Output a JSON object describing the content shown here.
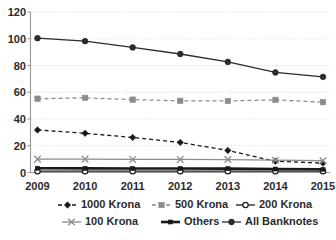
{
  "chart_data": {
    "type": "line",
    "title": "",
    "subtitle": "",
    "xlabel": "",
    "ylabel": "",
    "x": [
      "2009",
      "2010",
      "2011",
      "2012",
      "2013",
      "2014",
      "2015"
    ],
    "categories": [
      "2009",
      "2010",
      "2011",
      "2012",
      "2013",
      "2014",
      "2015"
    ],
    "ylim": [
      0,
      120
    ],
    "yticks": [
      0,
      20,
      40,
      60,
      80,
      100,
      120
    ],
    "ytick_labels": [
      "0",
      "20",
      "40",
      "60",
      "80",
      "100",
      "120"
    ],
    "xtick_labels": [
      "2009",
      "2010",
      "2011",
      "2012",
      "2013",
      "2014",
      "2015"
    ],
    "grid": "horizontal-dotted",
    "legend_position": "bottom",
    "legend_columns": 3,
    "series": [
      {
        "name": "1000 Krona",
        "values": [
          31.8,
          29.3,
          26.2,
          22.5,
          16.5,
          8.4,
          7.0
        ],
        "color": "#1a1a1a",
        "style": "dashed",
        "marker": "diamond"
      },
      {
        "name": "500 Krona",
        "values": [
          55.2,
          55.8,
          54.5,
          53.6,
          53.5,
          54.3,
          52.6
        ],
        "color": "#8c8c8c",
        "style": "dashed",
        "marker": "square"
      },
      {
        "name": "200 Krona",
        "values": [
          1.0,
          1.0,
          1.0,
          1.0,
          1.0,
          1.0,
          1.0
        ],
        "color": "#1a1a1a",
        "style": "solid",
        "marker": "circle-open"
      },
      {
        "name": "100 Krona",
        "values": [
          10.0,
          10.0,
          9.8,
          9.8,
          9.7,
          9.2,
          8.8
        ],
        "color": "#8c8c8c",
        "style": "solid",
        "marker": "cross"
      },
      {
        "name": "Others",
        "values": [
          3.2,
          3.1,
          3.0,
          3.0,
          2.9,
          2.6,
          2.4
        ],
        "color": "#1a1a1a",
        "style": "solid-bold",
        "marker": "square-small"
      },
      {
        "name": "All Banknotes",
        "values": [
          100.4,
          98.2,
          93.5,
          88.6,
          82.7,
          74.8,
          71.5
        ],
        "color": "#2b2b2b",
        "style": "solid",
        "marker": "circle"
      }
    ]
  },
  "legend": {
    "items": [
      {
        "label": "1000 Krona"
      },
      {
        "label": "500 Krona"
      },
      {
        "label": "200 Krona"
      },
      {
        "label": "100 Krona"
      },
      {
        "label": "Others"
      },
      {
        "label": "All Banknotes"
      }
    ]
  },
  "colors": {
    "black": "#1a1a1a",
    "gray": "#8c8c8c",
    "grid": "#d2d2d2",
    "axis": "#9a9a9a",
    "background": "#ffffff"
  }
}
